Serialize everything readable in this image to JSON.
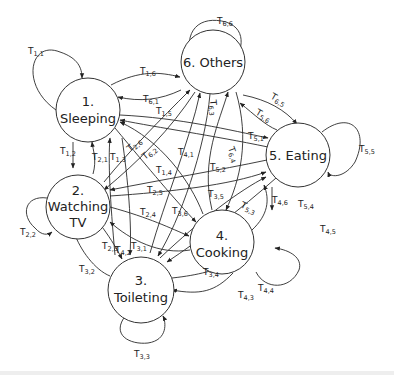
{
  "diagram": {
    "type": "state-transition-diagram",
    "nodes": [
      {
        "id": 1,
        "line1": "1.",
        "line2": "Sleeping"
      },
      {
        "id": 2,
        "line1": "2.",
        "line2": "Watching",
        "line3": "TV"
      },
      {
        "id": 3,
        "line1": "3.",
        "line2": "Toileting"
      },
      {
        "id": 4,
        "line1": "4.",
        "line2": "Cooking"
      },
      {
        "id": 5,
        "line1": "5. Eating"
      },
      {
        "id": 6,
        "line1": "6. Others"
      }
    ],
    "transitions": {
      "t11": {
        "T": "T",
        "sub": "1,1"
      },
      "t12": {
        "T": "T",
        "sub": "1,2"
      },
      "t13": {
        "T": "T",
        "sub": "1,3"
      },
      "t14": {
        "T": "T",
        "sub": "1,4"
      },
      "t15": {
        "T": "T",
        "sub": "1,5"
      },
      "t16": {
        "T": "T",
        "sub": "1,6"
      },
      "t21": {
        "T": "T",
        "sub": "2,1"
      },
      "t22": {
        "T": "T",
        "sub": "2,2"
      },
      "t23": {
        "T": "T",
        "sub": "2,3"
      },
      "t24": {
        "T": "T",
        "sub": "2,4"
      },
      "t25": {
        "T": "T",
        "sub": "2,5"
      },
      "t26": {
        "T": "T",
        "sub": "2,6"
      },
      "t31": {
        "T": "T",
        "sub": "3,1"
      },
      "t32": {
        "T": "T",
        "sub": "3,2"
      },
      "t33": {
        "T": "T",
        "sub": "3,3"
      },
      "t34": {
        "T": "T",
        "sub": "3,4"
      },
      "t35": {
        "T": "T",
        "sub": "3,5"
      },
      "t36": {
        "T": "T",
        "sub": "3,6"
      },
      "t41": {
        "T": "T",
        "sub": "4,1"
      },
      "t42": {
        "T": "T",
        "sub": "4,2"
      },
      "t43": {
        "T": "T",
        "sub": "4,3"
      },
      "t44": {
        "T": "T",
        "sub": "4,4"
      },
      "t45": {
        "T": "T",
        "sub": "4,5"
      },
      "t46": {
        "T": "T",
        "sub": "4,6"
      },
      "t51": {
        "T": "T",
        "sub": "5,1"
      },
      "t52": {
        "T": "T",
        "sub": "5,2"
      },
      "t53": {
        "T": "T",
        "sub": "5,3"
      },
      "t54": {
        "T": "T",
        "sub": "5,4"
      },
      "t55": {
        "T": "T",
        "sub": "5,5"
      },
      "t56": {
        "T": "T",
        "sub": "5,6"
      },
      "t61": {
        "T": "T",
        "sub": "6,1"
      },
      "t62": {
        "T": "T",
        "sub": "6,2"
      },
      "t63": {
        "T": "T",
        "sub": "6,3"
      },
      "t64": {
        "T": "T",
        "sub": "6,4"
      },
      "t65": {
        "T": "T",
        "sub": "6,5"
      },
      "t66": {
        "T": "T",
        "sub": "6,6"
      }
    }
  }
}
